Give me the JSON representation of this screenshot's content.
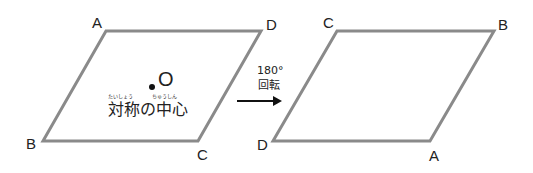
{
  "colors": {
    "shape_stroke": "#8a8a8a",
    "text": "#222222",
    "arrow": "#111111"
  },
  "left_figure": {
    "vertices": {
      "top_left": "A",
      "top_right": "D",
      "bottom_right": "C",
      "bottom_left": "B"
    },
    "center_label": "O",
    "center_caption": "対称の中心",
    "furigana_1": "たいしょう",
    "furigana_2": "ちゅうしん"
  },
  "transform": {
    "angle": "180°",
    "label": "回転",
    "arrow_icon": "right-arrow-icon"
  },
  "right_figure": {
    "vertices": {
      "top_left": "C",
      "top_right": "B",
      "bottom_right": "A",
      "bottom_left": "D"
    }
  }
}
